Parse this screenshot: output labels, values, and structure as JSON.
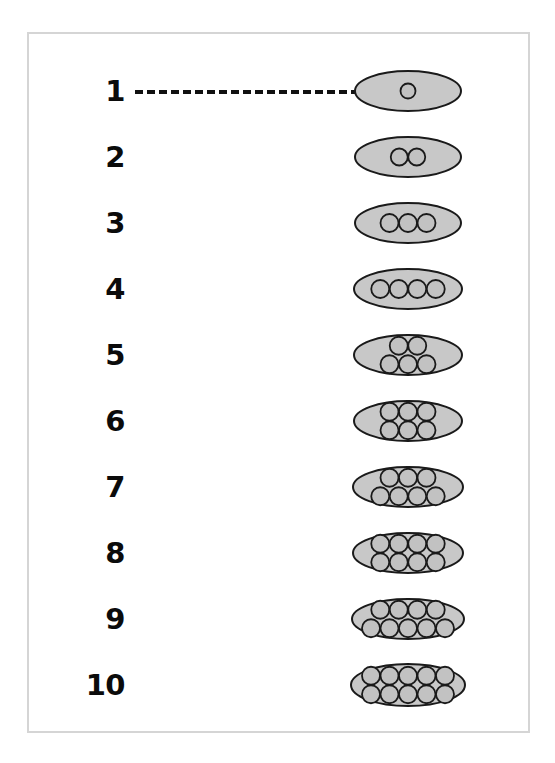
{
  "figure": {
    "type": "diagram",
    "frame_border_color": "#d5d5d5",
    "background_color": "#ffffff",
    "ellipse_fill_color": "#c8c8c8",
    "ellipse_stroke_color": "#1a1a1a",
    "circle_fill_color": "#c2c2c2",
    "circle_stroke_color": "#1a1a1a",
    "connector_color": "#111111",
    "label_color": "#0b0b0b",
    "connector_style": "dashed"
  },
  "chart_data": {
    "type": "diagram",
    "title": "",
    "xlabel": "",
    "ylabel": "",
    "categories": [
      "1",
      "2",
      "3",
      "4",
      "5",
      "6",
      "7",
      "8",
      "9",
      "10"
    ],
    "values": [
      1,
      2,
      3,
      4,
      5,
      6,
      7,
      8,
      9,
      10
    ]
  },
  "rows": [
    {
      "label": "1",
      "count": 1,
      "arrangement": [
        1
      ],
      "ellipse_rx": 53,
      "ellipse_ry": 20,
      "circle_r": 7.5,
      "has_connector": true
    },
    {
      "label": "2",
      "count": 2,
      "arrangement": [
        2
      ],
      "ellipse_rx": 53,
      "ellipse_ry": 20,
      "circle_r": 8.5,
      "has_connector": false
    },
    {
      "label": "3",
      "count": 3,
      "arrangement": [
        3
      ],
      "ellipse_rx": 53,
      "ellipse_ry": 20,
      "circle_r": 9,
      "has_connector": false
    },
    {
      "label": "4",
      "count": 4,
      "arrangement": [
        4
      ],
      "ellipse_rx": 54,
      "ellipse_ry": 20,
      "circle_r": 9,
      "has_connector": false
    },
    {
      "label": "5",
      "count": 5,
      "arrangement": [
        2,
        3
      ],
      "ellipse_rx": 54,
      "ellipse_ry": 20,
      "circle_r": 9,
      "has_connector": false
    },
    {
      "label": "6",
      "count": 6,
      "arrangement": [
        3,
        3
      ],
      "ellipse_rx": 54,
      "ellipse_ry": 20,
      "circle_r": 9,
      "has_connector": false
    },
    {
      "label": "7",
      "count": 7,
      "arrangement": [
        3,
        4
      ],
      "ellipse_rx": 55,
      "ellipse_ry": 20,
      "circle_r": 9,
      "has_connector": false
    },
    {
      "label": "8",
      "count": 8,
      "arrangement": [
        4,
        4
      ],
      "ellipse_rx": 55,
      "ellipse_ry": 20,
      "circle_r": 9,
      "has_connector": false
    },
    {
      "label": "9",
      "count": 9,
      "arrangement": [
        4,
        5
      ],
      "ellipse_rx": 56,
      "ellipse_ry": 20,
      "circle_r": 9,
      "has_connector": false
    },
    {
      "label": "10",
      "count": 10,
      "arrangement": [
        5,
        5
      ],
      "ellipse_rx": 57,
      "ellipse_ry": 21,
      "circle_r": 9,
      "has_connector": false
    }
  ],
  "layout": {
    "first_row_center_y": 91,
    "row_spacing": 66,
    "ellipse_center_x": 408,
    "label_right_x": 125
  }
}
